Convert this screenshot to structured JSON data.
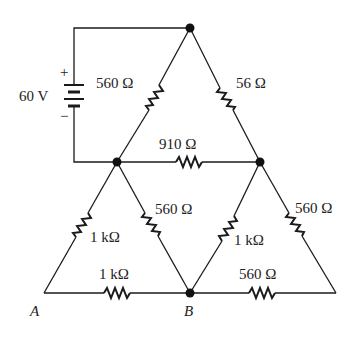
{
  "source": {
    "voltage_label": "60 V",
    "plus_sign": "+",
    "minus_sign": "−"
  },
  "resistors": {
    "top_left": "560 Ω",
    "top_right": "56 Ω",
    "middle": "910 Ω",
    "left_outer": "1 kΩ",
    "center_left": "560 Ω",
    "center_right": "1 kΩ",
    "right_outer": "560 Ω",
    "bottom_left": "1 kΩ",
    "bottom_right": "560 Ω"
  },
  "nodes": {
    "A": "A",
    "B": "B"
  },
  "colors": {
    "ink": "#1a1a1a",
    "background": "#ffffff"
  }
}
